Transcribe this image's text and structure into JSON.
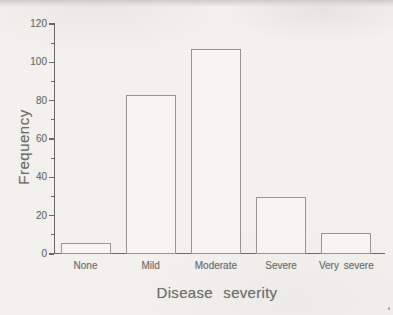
{
  "chart_data": {
    "type": "bar",
    "title": "",
    "categories": [
      "None",
      "Mild",
      "Moderate",
      "Severe",
      "Very severe"
    ],
    "values": [
      6,
      83,
      107,
      30,
      11
    ],
    "xlabel": "Disease severity",
    "ylabel": "Frequency",
    "ylim": [
      0,
      120
    ],
    "y_major_ticks": [
      0,
      20,
      40,
      60,
      80,
      100,
      120
    ],
    "y_minor_ticks": [
      10,
      30,
      50,
      70,
      90,
      110
    ],
    "grid": false,
    "legend": "none",
    "bar_style": "outlined-unfilled"
  },
  "style": {
    "background": "#f3f1ee",
    "axis_color": "#6a6a6a",
    "bar_border_color": "#989690",
    "bar_fill_color": "#f6f5f2",
    "text_color": "#6f6e6a"
  }
}
